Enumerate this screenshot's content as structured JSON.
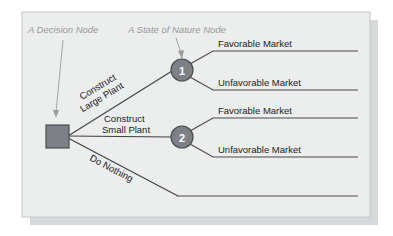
{
  "figure": {
    "kind": "decision-tree-diagram",
    "panel": {
      "fill": "#eceded",
      "border": "#b9bcbd",
      "shadow": "#d8d9da",
      "x": 22,
      "y": 12,
      "width": 348,
      "height": 205
    },
    "colors": {
      "branch_line": "#3f4042",
      "terminal_line": "#4a4b4d",
      "node_fill": "#7d8084",
      "node_stroke": "#4b4d50",
      "square_fill": "#7d8084",
      "square_stroke": "#4b4d50",
      "callout_text": "#97999c",
      "callout_arrow": "#9a9c9f",
      "label_text": "#1b1c1e"
    }
  },
  "callouts": [
    {
      "id": "decision-node-callout",
      "text": "A Decision Node",
      "text_x": 28,
      "text_y": 32,
      "arrow": {
        "x1": 63,
        "y1": 40,
        "x2": 56,
        "y2": 116
      }
    },
    {
      "id": "state-of-nature-callout",
      "text": "A State of Nature Node",
      "text_x": 128,
      "text_y": 32,
      "arrow": {
        "x1": 177,
        "y1": 38,
        "x2": 182,
        "y2": 58
      }
    }
  ],
  "nodes": {
    "decision": {
      "name": "decision-node-square",
      "x": 46,
      "y": 125,
      "size": 22
    },
    "state_of_nature": [
      {
        "name": "state-node-1",
        "label": "1",
        "cx": 182,
        "cy": 70,
        "r": 11
      },
      {
        "name": "state-node-2",
        "label": "2",
        "cx": 182,
        "cy": 137,
        "r": 11
      }
    ]
  },
  "decision_branches": [
    {
      "id": "construct-large-plant",
      "line1": "Construct",
      "line2": "Large Plant",
      "rotation": -30,
      "label_x": 78,
      "label_y": 96,
      "path": "M 68 136 L 171 70"
    },
    {
      "id": "construct-small-plant",
      "line1": "Construct",
      "line2": "Small Plant",
      "rotation": 0,
      "label_x": 101,
      "label_y": 118,
      "path": "M 68 136 L 171 137"
    },
    {
      "id": "do-nothing",
      "line1": "Do Nothing",
      "line2": "",
      "rotation": 27,
      "label_x": 88,
      "label_y": 158,
      "path": "M 68 137 L 178 196"
    }
  ],
  "outcomes": [
    {
      "id": "node1-favorable",
      "label": "Favorable Market",
      "from_node": "1",
      "elbow": "M 190 64 L 213 51 L 358 51",
      "text_x": 218,
      "text_y": 47
    },
    {
      "id": "node1-unfavorable",
      "label": "Unfavorable Market",
      "from_node": "1",
      "elbow": "M 190 77 L 213 90 L 358 90",
      "text_x": 218,
      "text_y": 86
    },
    {
      "id": "node2-favorable",
      "label": "Favorable Market",
      "from_node": "2",
      "elbow": "M 190 131 L 213 118 L 358 118",
      "text_x": 218,
      "text_y": 114
    },
    {
      "id": "node2-unfavorable",
      "label": "Unfavorable Market",
      "from_node": "2",
      "elbow": "M 190 144 L 213 157 L 358 157",
      "text_x": 218,
      "text_y": 153
    },
    {
      "id": "do-nothing-terminal",
      "label": "",
      "from_node": "decision",
      "elbow": "M 178 196 L 358 196",
      "text_x": 0,
      "text_y": 0
    }
  ]
}
